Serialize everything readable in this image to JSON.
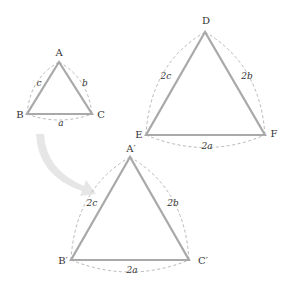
{
  "colors": {
    "background": "#ffffff",
    "triangle_stroke": "#a9a9a9",
    "arc_stroke": "#b8b8b8",
    "arrow_fill": "#e6e6e6",
    "text": "#333333"
  },
  "triangles": [
    {
      "id": "ABC",
      "vertices": {
        "A": "A",
        "B": "B",
        "C": "C"
      },
      "sides": {
        "a": "a",
        "b": "b",
        "c": "c"
      }
    },
    {
      "id": "DEF",
      "vertices": {
        "D": "D",
        "E": "E",
        "F": "F"
      },
      "sides": {
        "a": "2a",
        "b": "2b",
        "c": "2c"
      }
    },
    {
      "id": "A'B'C'",
      "vertices": {
        "A": "A′",
        "B": "B′",
        "C": "C′"
      },
      "sides": {
        "a": "2a",
        "b": "2b",
        "c": "2c"
      }
    }
  ],
  "arrow": {
    "icon": "curved-arrow-icon",
    "from": "ABC",
    "to": "A'B'C'"
  }
}
